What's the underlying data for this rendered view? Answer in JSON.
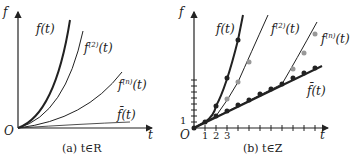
{
  "panel_a": {
    "y_axis": "f",
    "x_axis": "t",
    "origin": "O",
    "curves": [
      {
        "label_base": "f(t)",
        "label": "f(t)"
      },
      {
        "label_base": "f",
        "sup": "(2)",
        "tail": "(t)"
      },
      {
        "label_base": "f",
        "sup": "(n)",
        "tail": "(t)"
      },
      {
        "label": "f̄(t)"
      }
    ],
    "caption": "(a) t∈R"
  },
  "panel_b": {
    "y_axis": "f",
    "x_axis": "t",
    "origin": "O",
    "y_tick": "1",
    "x_ticks": [
      "1",
      "2",
      "3"
    ],
    "curves": [
      {
        "label": "f(t)"
      },
      {
        "label_base": "f",
        "sup": "(2)",
        "tail": "(t)"
      },
      {
        "label_base": "f",
        "sup": "(n)",
        "tail": "(t)"
      },
      {
        "label": "f̄(t)"
      }
    ],
    "caption": "(b) t∈Z"
  }
}
